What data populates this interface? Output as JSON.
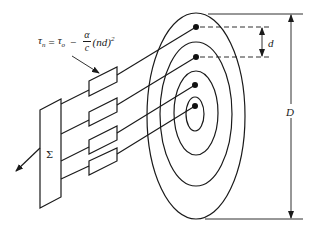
{
  "diagram": {
    "title": "",
    "formula": {
      "lhs": "τ",
      "lhs_sub": "n",
      "equals": "=",
      "tau0": "τ",
      "tau0_sub": "o",
      "minus": "−",
      "frac_num": "α",
      "frac_den": "c",
      "tail": "(nd)",
      "exp": "2"
    },
    "summer_label": "Σ",
    "labels": {
      "ring_spacing": "d",
      "outer_diameter": "D"
    },
    "components": {
      "summer": "summing junction Σ",
      "delay_blocks": 4,
      "rings": 4,
      "taps": 4
    },
    "colors": {
      "line": "#1a1a1a",
      "background": "#ffffff"
    }
  }
}
